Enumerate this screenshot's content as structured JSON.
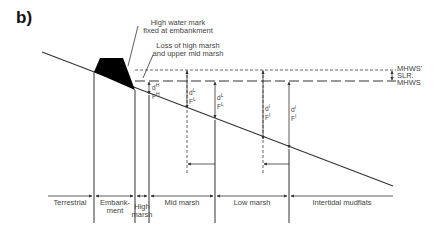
{
  "panel_label": "b)",
  "annotations": {
    "high_water_mark_line1": "High water mark",
    "high_water_mark_line2": "fixed at embankment",
    "loss_line1": "Loss of high marsh",
    "loss_line2": "and upper mid marsh"
  },
  "levels": {
    "mhws_prime": "MHWS'",
    "slr": "SLR.",
    "mhws": "MHWS"
  },
  "depth_labels": [
    {
      "d": "d",
      "sup": "H",
      "f": "F",
      "fsup": "H"
    },
    {
      "d": "d",
      "sup": "L",
      "f": "F",
      "fsup": "L"
    },
    {
      "d": "d",
      "sup": "L",
      "f": "F",
      "fsup": "L"
    },
    {
      "d": "d",
      "sup": "I",
      "f": "F",
      "fsup": "I"
    },
    {
      "d": "d",
      "sup": "I",
      "f": "F",
      "fsup": "I"
    }
  ],
  "zones": [
    {
      "label": "Terrestrial"
    },
    {
      "label": "Embank-",
      "label2": "ment"
    },
    {
      "label": "High",
      "label2": "marsh"
    },
    {
      "label": "Mid marsh"
    },
    {
      "label": "Low marsh"
    },
    {
      "label": "Intertidal mudflats"
    }
  ],
  "colors": {
    "line": "#333333",
    "embankment_fill": "#000000",
    "background": "#ffffff"
  }
}
